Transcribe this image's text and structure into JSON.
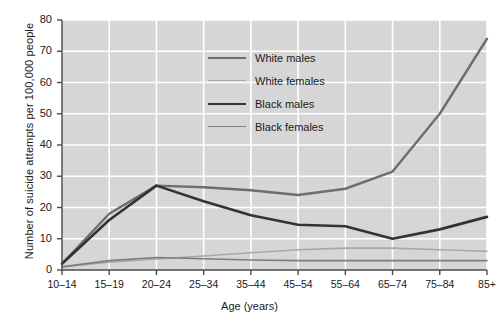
{
  "chart_data": {
    "type": "line",
    "title": "",
    "xlabel": "Age (years)",
    "ylabel": "Number of suicide attempts per 100,000 people",
    "categories": [
      "10–14",
      "15–19",
      "20–24",
      "25–34",
      "35–44",
      "45–54",
      "55–64",
      "65–74",
      "75–84",
      "85+"
    ],
    "ylim": [
      0,
      80
    ],
    "yticks": [
      0,
      10,
      20,
      30,
      40,
      50,
      60,
      70,
      80
    ],
    "grid": true,
    "legend_position": "upper-center",
    "plot_background": "#d6d6d6",
    "gridline_color": "#ffffff",
    "series": [
      {
        "name": "White males",
        "color": "#6e6e6e",
        "width": 2.4,
        "values": [
          2,
          18,
          27,
          26.5,
          25.5,
          24,
          26,
          31.5,
          50,
          74
        ]
      },
      {
        "name": "White females",
        "color": "#a8a8a8",
        "width": 1.6,
        "values": [
          1,
          2.5,
          3.5,
          4.5,
          5.5,
          6.5,
          7,
          7,
          6.5,
          6
        ]
      },
      {
        "name": "Black males",
        "color": "#333333",
        "width": 2.6,
        "values": [
          2,
          16,
          27,
          22,
          17.5,
          14.5,
          14,
          10,
          13,
          17
        ]
      },
      {
        "name": "Black females",
        "color": "#7d7d7d",
        "width": 1.7,
        "values": [
          1,
          3,
          4,
          3.6,
          3.2,
          3,
          3,
          3,
          3,
          3
        ]
      }
    ]
  },
  "legend": {
    "items": [
      {
        "label": "White males"
      },
      {
        "label": "White females"
      },
      {
        "label": "Black males"
      },
      {
        "label": "Black females"
      }
    ]
  },
  "axes": {
    "x_title": "Age (years)",
    "y_title": "Number of suicide attempts per 100,000 people"
  }
}
